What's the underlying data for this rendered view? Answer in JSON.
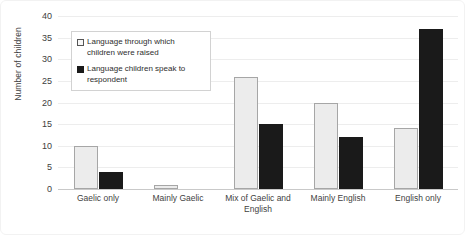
{
  "chart_data": {
    "type": "bar",
    "title": "",
    "xlabel": "",
    "ylabel": "Number of children",
    "ylim": [
      0,
      40
    ],
    "yticks": [
      40,
      35,
      30,
      25,
      20,
      15,
      10,
      5,
      0
    ],
    "grid": true,
    "legend_position": "upper-left-inside",
    "categories": [
      "Gaelic only",
      "Mainly Gaelic",
      "Mix of Gaelic and English",
      "Mainly English",
      "English only"
    ],
    "series": [
      {
        "name": "Language through which children were raised",
        "color": "#ececec",
        "values": [
          10,
          1,
          26,
          20,
          14
        ]
      },
      {
        "name": "Language children speak to respondent",
        "color": "#1a1a1a",
        "values": [
          4,
          0,
          15,
          12,
          37
        ]
      }
    ]
  },
  "axis": {
    "y_title": "Number of children",
    "y_ticks": [
      "40",
      "35",
      "30",
      "25",
      "20",
      "15",
      "10",
      "5",
      "0"
    ],
    "x_ticks": [
      "Gaelic only",
      "Mainly Gaelic",
      "Mix of Gaelic and English",
      "Mainly English",
      "English only"
    ]
  },
  "legend": {
    "items": [
      {
        "label": "Language through which children were raised",
        "swatch": "open-square-icon"
      },
      {
        "label": "Language children speak to respondent",
        "swatch": "filled-square-icon"
      }
    ]
  },
  "colors": {
    "series_raised": "#ececec",
    "series_raised_border": "#a6a6a6",
    "series_speak": "#1a1a1a",
    "gridline": "#ededed",
    "axis": "#c9c9c9",
    "text": "#3f3f3f"
  }
}
